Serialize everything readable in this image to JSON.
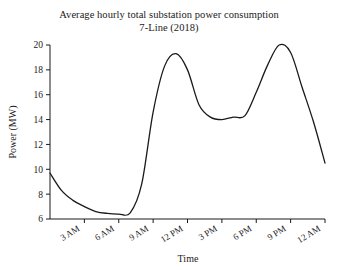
{
  "chart_data": {
    "type": "line",
    "title": "Average hourly total substation power consumption",
    "subtitle": "7-Line (2018)",
    "xlabel": "Time",
    "ylabel": "Power (MW)",
    "grid": false,
    "legend": null,
    "xlim": [
      0,
      24
    ],
    "ylim": [
      6,
      20
    ],
    "yticks": [
      6,
      8,
      10,
      12,
      14,
      16,
      18,
      20
    ],
    "ytick_labels": [
      "6",
      "8",
      "10",
      "12",
      "14",
      "16",
      "18",
      "20"
    ],
    "xticks": [
      3,
      6,
      9,
      12,
      15,
      18,
      21,
      24
    ],
    "xtick_labels": [
      "3 AM",
      "6 AM",
      "9 AM",
      "12 PM",
      "3 PM",
      "6 PM",
      "9 PM",
      "12 AM"
    ],
    "line_color": "#1a1a1a",
    "line_width": 1.3,
    "x": [
      0,
      1,
      2,
      3,
      4,
      5,
      6,
      7,
      8,
      9,
      10,
      11,
      12,
      13,
      14,
      15,
      16,
      17,
      18,
      19,
      20,
      21,
      22,
      23,
      24
    ],
    "values": [
      9.7,
      8.3,
      7.5,
      7.0,
      6.6,
      6.45,
      6.4,
      6.5,
      6.6,
      9.6,
      13.2,
      16.4,
      18.2,
      19.1,
      19.3,
      18.6,
      16.2,
      14.6,
      14.1,
      14.0,
      14.1,
      14.3,
      14.3,
      14.8,
      16.0
    ],
    "series": [
      {
        "name": "7-Line total substation power",
        "units": "MW",
        "points": [
          {
            "time": "12 AM",
            "hour": 0,
            "value": 9.7
          },
          {
            "time": "1 AM",
            "hour": 1,
            "value": 8.3
          },
          {
            "time": "2 AM",
            "hour": 2,
            "value": 7.5
          },
          {
            "time": "3 AM",
            "hour": 3,
            "value": 7.0
          },
          {
            "time": "4 AM",
            "hour": 4,
            "value": 6.6
          },
          {
            "time": "5 AM",
            "hour": 5,
            "value": 6.45
          },
          {
            "time": "6 AM",
            "hour": 6,
            "value": 6.4
          },
          {
            "time": "7 AM",
            "hour": 7,
            "value": 6.5
          },
          {
            "time": "8 AM",
            "hour": 8,
            "value": 8.8
          },
          {
            "time": "9 AM",
            "hour": 9,
            "value": 14.6
          },
          {
            "time": "10 AM",
            "hour": 10,
            "value": 18.3
          },
          {
            "time": "11 AM",
            "hour": 11,
            "value": 19.3
          },
          {
            "time": "12 PM",
            "hour": 12,
            "value": 18.0
          },
          {
            "time": "1 PM",
            "hour": 13,
            "value": 15.2
          },
          {
            "time": "2 PM",
            "hour": 14,
            "value": 14.2
          },
          {
            "time": "3 PM",
            "hour": 15,
            "value": 14.0
          },
          {
            "time": "4 PM",
            "hour": 16,
            "value": 14.2
          },
          {
            "time": "5 PM",
            "hour": 17,
            "value": 14.3
          },
          {
            "time": "6 PM",
            "hour": 18,
            "value": 16.2
          },
          {
            "time": "7 PM",
            "hour": 19,
            "value": 18.4
          },
          {
            "time": "8 PM",
            "hour": 20,
            "value": 20.0
          },
          {
            "time": "9 PM",
            "hour": 21,
            "value": 19.4
          },
          {
            "time": "10 PM",
            "hour": 22,
            "value": 16.6
          },
          {
            "time": "11 PM",
            "hour": 23,
            "value": 13.8
          },
          {
            "time": "12 AM",
            "hour": 24,
            "value": 10.5
          }
        ]
      }
    ],
    "annotations": {
      "morning_peak": {
        "value": 19.3,
        "approx_time": "10-11 AM"
      },
      "evening_peak": {
        "value": 20.0,
        "approx_time": "7-8 PM"
      },
      "overnight_minimum": {
        "value": 6.4,
        "approx_time": "5-6 AM"
      },
      "midday_plateau": {
        "value": 14.1,
        "approx_time": "2-5 PM"
      },
      "start_value": 9.7,
      "end_value": 10.5
    }
  }
}
